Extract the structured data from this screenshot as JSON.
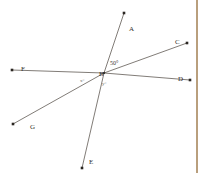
{
  "figure": {
    "background_color": "#ffffff",
    "line_color": "#4a443c",
    "label_color": "#33302c",
    "border_color": "#b99f7d",
    "width": 202,
    "height": 173
  },
  "points": [
    {
      "id": "A",
      "label": "A",
      "x": 129,
      "y": 26,
      "tip_x": 124,
      "tip_y": 13
    },
    {
      "id": "B",
      "label": "B",
      "x": 99,
      "y": 71,
      "tip_x": 104,
      "tip_y": 73
    },
    {
      "id": "C",
      "label": "C",
      "x": 175,
      "y": 39,
      "tip_x": 187,
      "tip_y": 43
    },
    {
      "id": "D",
      "label": "D",
      "x": 178,
      "y": 76,
      "tip_x": 190,
      "tip_y": 80
    },
    {
      "id": "E",
      "label": "E",
      "x": 89,
      "y": 159,
      "tip_x": 82,
      "tip_y": 168
    },
    {
      "id": "F",
      "label": "F",
      "x": 21,
      "y": 66,
      "tip_x": 12,
      "tip_y": 70
    },
    {
      "id": "G",
      "label": "G",
      "x": 30,
      "y": 124,
      "tip_x": 13,
      "tip_y": 124
    }
  ],
  "rays": [
    {
      "name": "ray-BA",
      "from": "B",
      "to": "A",
      "x1": 104,
      "y1": 73,
      "x2": 124,
      "y2": 13
    },
    {
      "name": "ray-BE",
      "from": "B",
      "to": "E",
      "x1": 104,
      "y1": 73,
      "x2": 82,
      "y2": 168
    },
    {
      "name": "ray-BC",
      "from": "B",
      "to": "C",
      "x1": 104,
      "y1": 73,
      "x2": 187,
      "y2": 43
    },
    {
      "name": "ray-BG",
      "from": "B",
      "to": "G",
      "x1": 104,
      "y1": 73,
      "x2": 13,
      "y2": 124
    },
    {
      "name": "ray-BD",
      "from": "B",
      "to": "D",
      "x1": 104,
      "y1": 73,
      "x2": 190,
      "y2": 80
    },
    {
      "name": "ray-BF",
      "from": "B",
      "to": "F",
      "x1": 104,
      "y1": 73,
      "x2": 12,
      "y2": 70
    }
  ],
  "angles": [
    {
      "id": "angle-ABC",
      "label": "50°",
      "x": 110,
      "y": 60,
      "size": "normal"
    },
    {
      "id": "angle-FBG",
      "label": "x°",
      "x": 80,
      "y": 78,
      "size": "small"
    },
    {
      "id": "angle-DBE",
      "label": "y°",
      "x": 102,
      "y": 81,
      "size": "small"
    }
  ],
  "border": {
    "name": "right-edge-border",
    "x": 196,
    "color": "#b99f7d"
  }
}
